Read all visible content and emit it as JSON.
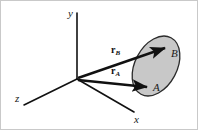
{
  "figure": {
    "kind": "3d-coordinate-vector-diagram",
    "background_color": "#ffffff",
    "border_color": "#c9c9c9",
    "line_color": "#111111",
    "width": 198,
    "height": 130
  },
  "axes": {
    "origin": {
      "x": 76,
      "y": 78
    },
    "items": [
      {
        "name": "y",
        "label": "y",
        "label_x": 67,
        "label_y": 16,
        "from_x": 76,
        "from_y": 78,
        "to_x": 76,
        "to_y": 12,
        "stroke_width": 1.6
      },
      {
        "name": "z",
        "label": "z",
        "label_x": 14,
        "label_y": 101,
        "from_x": 76,
        "from_y": 78,
        "to_x": 23,
        "to_y": 104,
        "stroke_width": 1.6
      },
      {
        "name": "x",
        "label": "x",
        "label_x": 133,
        "label_y": 122,
        "from_x": 76,
        "from_y": 78,
        "to_x": 133,
        "to_y": 111,
        "stroke_width": 1.6
      }
    ]
  },
  "surface": {
    "name": "shaded-ellipse",
    "center_x": 155,
    "center_y": 65,
    "radius_x": 21,
    "radius_y": 32,
    "rotation_deg": 28,
    "fill_color": "#c8c8c8",
    "stroke_color": "#2b2b2b",
    "stroke_width": 1.3
  },
  "vectors": [
    {
      "name": "r-b",
      "label_main": "r",
      "label_sub": "B",
      "label_x": 110,
      "label_y": 52,
      "from_x": 77,
      "from_y": 77,
      "to_x": 164,
      "to_y": 47,
      "stroke_width": 2.4,
      "endpoint_label": "B",
      "endpoint_label_x": 170,
      "endpoint_label_y": 56
    },
    {
      "name": "r-a",
      "label_main": "r",
      "label_sub": "A",
      "label_x": 110,
      "label_y": 73,
      "from_x": 77,
      "from_y": 79,
      "to_x": 146,
      "to_y": 86,
      "stroke_width": 2.4,
      "endpoint_label": "A",
      "endpoint_label_x": 152,
      "endpoint_label_y": 90
    }
  ],
  "points": [
    {
      "name": "point-b",
      "label": "B",
      "x": 170,
      "y": 56
    },
    {
      "name": "point-a",
      "label": "A",
      "x": 152,
      "y": 90
    }
  ]
}
